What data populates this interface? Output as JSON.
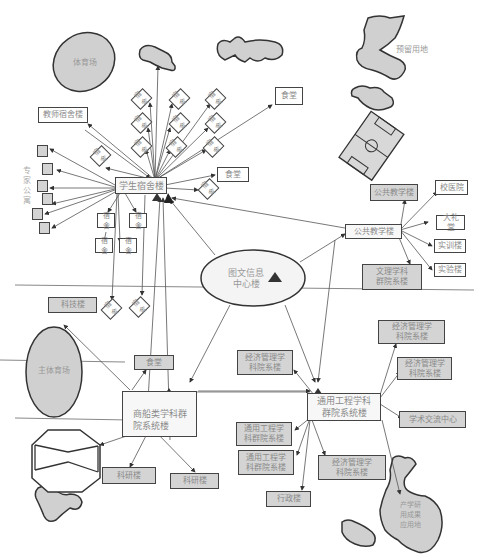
{
  "diagram": {
    "title": "",
    "regions": {
      "stadium": "体育场",
      "main_stadium": "主体育场",
      "reserved_land": "预留用地",
      "expert_apartment": "专家公寓",
      "industry_research": "产学研用成果应用地"
    },
    "hubs": {
      "student_dorm": "学生宿舍楼",
      "library": "图文信息中心楼",
      "library_line1": "图文信息",
      "library_line2": "中心楼",
      "public_teaching": "公共教学楼",
      "shipping_dept": "商船类学科群院系统楼",
      "shipping_line1": "商船类学科群",
      "shipping_line2": "院系统楼",
      "general_eng": "通用工程学科群院系统楼",
      "general_eng_line1": "通用工程学科",
      "general_eng_line2": "群院系统楼"
    },
    "dorm_children": {
      "teacher_dorm": "教师宿舍楼",
      "dorm": "宿舍",
      "canteen": "食堂",
      "canteen2": "食堂"
    },
    "teaching_children": {
      "public_teaching_gray": "公共教学楼",
      "hospital": "校医院",
      "auditorium": "大礼堂",
      "training": "实训楼",
      "lab": "实验楼",
      "liberal_arts_line1": "文理学科",
      "liberal_arts_line2": "群院系楼"
    },
    "shipping_children": {
      "science_building": "科技楼",
      "canteen": "食堂",
      "research1": "科研楼",
      "research2": "科研楼"
    },
    "eng_children": {
      "econ_mgmt_line1": "经济管理学",
      "econ_mgmt_line2": "科院系楼",
      "general_eng_line1": "通用工程学",
      "general_eng_line2": "科群院系楼",
      "academic_exchange": "学术交流中心",
      "admin": "行政楼"
    },
    "colors": {
      "line": "#555555",
      "region_fill": "#d0d0d0",
      "gray_box": "#d4d4d4",
      "text": "#8a8a8a",
      "marker": "#444444"
    }
  }
}
